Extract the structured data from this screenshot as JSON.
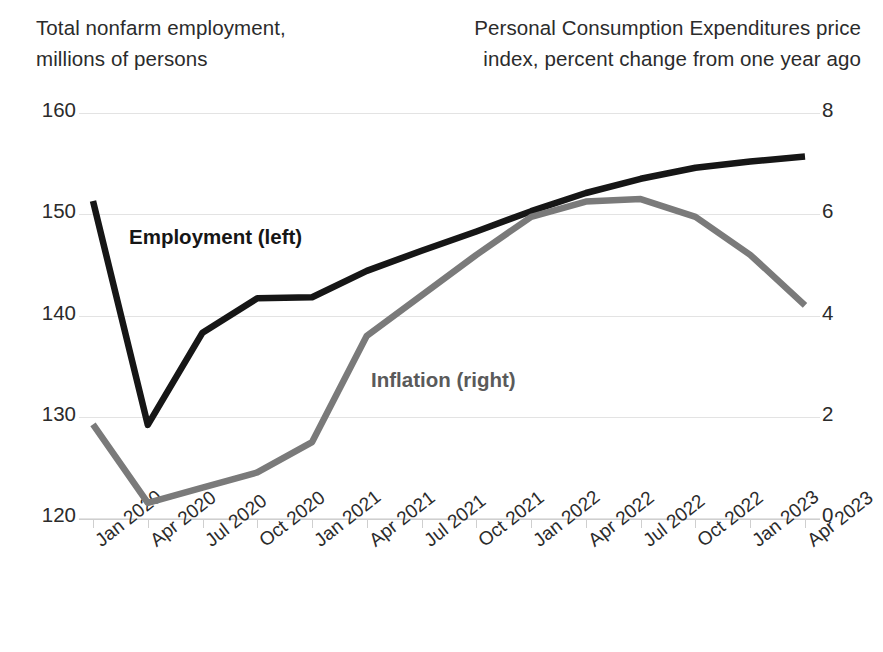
{
  "chart_data": {
    "type": "line",
    "title": "",
    "xlabel": "",
    "categories": [
      "Jan 2020",
      "Apr 2020",
      "Jul 2020",
      "Oct 2020",
      "Jan 2021",
      "Apr 2021",
      "Jul 2021",
      "Oct 2021",
      "Jan 2022",
      "Apr 2022",
      "Jul 2022",
      "Oct 2022",
      "Jan 2023",
      "Apr 2023"
    ],
    "grid": true,
    "legend_position": "inline-annotation",
    "axes": {
      "left": {
        "title": "Total nonfarm employment,\nmillions of persons",
        "ticks": [
          160,
          150,
          140,
          130,
          120
        ],
        "ylim": [
          120,
          160
        ],
        "units": "millions of persons"
      },
      "right": {
        "title": "Personal Consumption Expenditures price\nindex, percent change from one year ago",
        "ticks": [
          8,
          6,
          4,
          2,
          0
        ],
        "ylim": [
          0,
          8
        ],
        "units": "percent change from one year ago"
      }
    },
    "series": [
      {
        "name": "Employment (left)",
        "label": "Employment (left)",
        "axis": "left",
        "color": "#161616",
        "values": [
          151.3,
          129.2,
          138.3,
          141.7,
          141.8,
          144.4,
          146.4,
          148.3,
          150.3,
          152.1,
          153.5,
          154.6,
          155.2,
          155.7
        ]
      },
      {
        "name": "Inflation (right)",
        "label": "Inflation (right)",
        "axis": "right",
        "color": "#7a7a7a",
        "values": [
          1.85,
          0.3,
          0.6,
          0.9,
          1.5,
          3.6,
          4.4,
          5.2,
          5.95,
          6.25,
          6.3,
          5.95,
          5.2,
          4.2
        ]
      }
    ]
  }
}
